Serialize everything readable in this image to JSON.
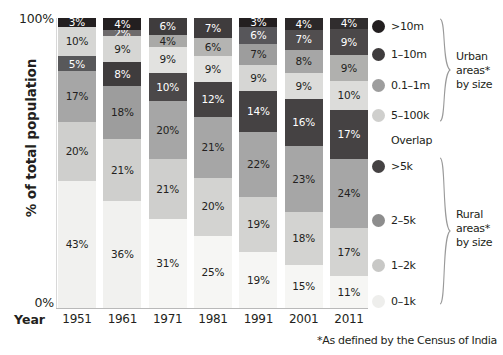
{
  "chart_data": {
    "type": "bar",
    "variant": "stacked-100",
    "title": "",
    "xlabel": "Year",
    "ylabel": "% of total population",
    "ylim": [
      0,
      100
    ],
    "ytick_labels": [
      "100%",
      "0%"
    ],
    "grid": false,
    "legend_position": "right",
    "categories": [
      "1951",
      "1961",
      "1971",
      "1981",
      "1991",
      "2001",
      "2011"
    ],
    "series": [
      {
        "name": ">10m",
        "group": "Urban areas* by size",
        "color": "#231f20",
        "values": [
          3,
          4,
          6,
          7,
          3,
          4,
          4
        ]
      },
      {
        "name": "1–10m",
        "group": "Urban areas* by size",
        "color": "#3f3c3d",
        "values": [
          null,
          2,
          4,
          6,
          6,
          7,
          9
        ]
      },
      {
        "name": "0.1–1m",
        "group": "Urban areas* by size",
        "color": "#9d9d9d",
        "values": [
          10,
          9,
          9,
          9,
          7,
          8,
          9
        ]
      },
      {
        "name": "5–100k",
        "group": "Urban areas* by size",
        "color": "#d6d6d4",
        "values": [
          null,
          null,
          null,
          null,
          9,
          9,
          10
        ]
      },
      {
        "name": ">5k",
        "group": "Overlap / Rural areas* by size",
        "color": "#58585a",
        "values": [
          5,
          8,
          10,
          12,
          14,
          16,
          17
        ]
      },
      {
        "name": "2–5k",
        "group": "Rural areas* by size",
        "color": "#a6a6a6",
        "values": [
          17,
          18,
          20,
          21,
          22,
          23,
          24
        ]
      },
      {
        "name": "1–2k",
        "group": "Rural areas* by size",
        "color": "#cfcfcd",
        "values": [
          20,
          21,
          21,
          20,
          19,
          18,
          17
        ]
      },
      {
        "name": "0–1k",
        "group": "Rural areas* by size",
        "color": "#f1f1ef",
        "values": [
          43,
          36,
          31,
          25,
          19,
          15,
          11
        ]
      }
    ],
    "columns": [
      {
        "year": "1951",
        "segments": [
          {
            "label": "3%",
            "value": 3,
            "color": "#231f20",
            "text": "#ffffff"
          },
          {
            "label": "10%",
            "value": 10,
            "color": "#d6d6d4",
            "text": "#231f20"
          },
          {
            "label": "5%",
            "value": 5,
            "color": "#58585a",
            "text": "#ffffff"
          },
          {
            "label": "17%",
            "value": 17,
            "color": "#a6a6a6",
            "text": "#231f20"
          },
          {
            "label": "20%",
            "value": 20,
            "color": "#cfcfcd",
            "text": "#231f20"
          },
          {
            "label": "43%",
            "value": 43,
            "color": "#f1f1ef",
            "text": "#231f20"
          }
        ]
      },
      {
        "year": "1961",
        "segments": [
          {
            "label": "4%",
            "value": 4,
            "color": "#231f20",
            "text": "#ffffff"
          },
          {
            "label": "2%",
            "value": 2,
            "color": "#6e6b6c",
            "text": "#ffffff"
          },
          {
            "label": "9%",
            "value": 9,
            "color": "#d6d6d4",
            "text": "#231f20"
          },
          {
            "label": "8%",
            "value": 8,
            "color": "#3f3c3d",
            "text": "#ffffff"
          },
          {
            "label": "18%",
            "value": 18,
            "color": "#9d9d9d",
            "text": "#231f20"
          },
          {
            "label": "21%",
            "value": 21,
            "color": "#cfcfcd",
            "text": "#231f20"
          },
          {
            "label": "36%",
            "value": 36,
            "color": "#f1f1ef",
            "text": "#231f20"
          }
        ]
      },
      {
        "year": "1971",
        "segments": [
          {
            "label": "6%",
            "value": 6,
            "color": "#3f3c3d",
            "text": "#ffffff"
          },
          {
            "label": "4%",
            "value": 4,
            "color": "#a9a9a7",
            "text": "#231f20"
          },
          {
            "label": "9%",
            "value": 9,
            "color": "#e2e2e0",
            "text": "#231f20"
          },
          {
            "label": "10%",
            "value": 10,
            "color": "#4b4849",
            "text": "#ffffff"
          },
          {
            "label": "20%",
            "value": 20,
            "color": "#a6a6a6",
            "text": "#231f20"
          },
          {
            "label": "21%",
            "value": 21,
            "color": "#cfcfcd",
            "text": "#231f20"
          },
          {
            "label": "31%",
            "value": 31,
            "color": "#f6f6f4",
            "text": "#231f20"
          }
        ]
      },
      {
        "year": "1981",
        "segments": [
          {
            "label": "7%",
            "value": 7,
            "color": "#3f3c3d",
            "text": "#ffffff"
          },
          {
            "label": "6%",
            "value": 6,
            "color": "#b4b4b2",
            "text": "#231f20"
          },
          {
            "label": "9%",
            "value": 9,
            "color": "#e2e2e0",
            "text": "#231f20"
          },
          {
            "label": "12%",
            "value": 12,
            "color": "#454243",
            "text": "#ffffff"
          },
          {
            "label": "21%",
            "value": 21,
            "color": "#a6a6a6",
            "text": "#231f20"
          },
          {
            "label": "20%",
            "value": 20,
            "color": "#d3d3d1",
            "text": "#231f20"
          },
          {
            "label": "25%",
            "value": 25,
            "color": "#f6f6f4",
            "text": "#231f20"
          }
        ]
      },
      {
        "year": "1991",
        "segments": [
          {
            "label": "3%",
            "value": 3,
            "color": "#231f20",
            "text": "#ffffff"
          },
          {
            "label": "6%",
            "value": 6,
            "color": "#57565a",
            "text": "#ffffff"
          },
          {
            "label": "7%",
            "value": 7,
            "color": "#9d9d9d",
            "text": "#231f20"
          },
          {
            "label": "9%",
            "value": 9,
            "color": "#d6d6d4",
            "text": "#231f20"
          },
          {
            "label": "14%",
            "value": 14,
            "color": "#454243",
            "text": "#ffffff"
          },
          {
            "label": "22%",
            "value": 22,
            "color": "#a6a6a6",
            "text": "#231f20"
          },
          {
            "label": "19%",
            "value": 19,
            "color": "#d3d3d1",
            "text": "#231f20"
          },
          {
            "label": "19%",
            "value": 19,
            "color": "#f6f6f4",
            "text": "#231f20"
          }
        ]
      },
      {
        "year": "2001",
        "segments": [
          {
            "label": "4%",
            "value": 4,
            "color": "#2b2829",
            "text": "#ffffff"
          },
          {
            "label": "7%",
            "value": 7,
            "color": "#514e4f",
            "text": "#ffffff"
          },
          {
            "label": "8%",
            "value": 8,
            "color": "#a6a6a6",
            "text": "#231f20"
          },
          {
            "label": "9%",
            "value": 9,
            "color": "#dcdcda",
            "text": "#231f20"
          },
          {
            "label": "16%",
            "value": 16,
            "color": "#454243",
            "text": "#ffffff"
          },
          {
            "label": "23%",
            "value": 23,
            "color": "#a6a6a6",
            "text": "#231f20"
          },
          {
            "label": "18%",
            "value": 18,
            "color": "#d3d3d1",
            "text": "#231f20"
          },
          {
            "label": "15%",
            "value": 15,
            "color": "#f6f6f4",
            "text": "#231f20"
          }
        ]
      },
      {
        "year": "2011",
        "segments": [
          {
            "label": "4%",
            "value": 4,
            "color": "#302d2e",
            "text": "#ffffff"
          },
          {
            "label": "9%",
            "value": 9,
            "color": "#4b4849",
            "text": "#ffffff"
          },
          {
            "label": "9%",
            "value": 9,
            "color": "#b0b0ae",
            "text": "#231f20"
          },
          {
            "label": "10%",
            "value": 10,
            "color": "#dcdcda",
            "text": "#231f20"
          },
          {
            "label": "17%",
            "value": 17,
            "color": "#454243",
            "text": "#ffffff"
          },
          {
            "label": "24%",
            "value": 24,
            "color": "#a6a6a6",
            "text": "#231f20"
          },
          {
            "label": "17%",
            "value": 17,
            "color": "#d3d3d1",
            "text": "#231f20"
          },
          {
            "label": "11%",
            "value": 11,
            "color": "#f6f6f4",
            "text": "#231f20"
          }
        ]
      }
    ]
  },
  "axis": {
    "y_title": "% of total population",
    "y_top_label": "100%",
    "y_bottom_label": "0%",
    "x_title": "Year"
  },
  "legend": {
    "entries": [
      {
        "label": ">10m",
        "color": "#231f20"
      },
      {
        "label": "1–10m",
        "color": "#3f3c3d"
      },
      {
        "label": "0.1–1m",
        "color": "#9d9d9d"
      },
      {
        "label": "5–100k",
        "color": "#cfcfcd"
      },
      {
        "label": ">5k",
        "color": "#454243"
      },
      {
        "label": "2–5k",
        "color": "#8d8d8d"
      },
      {
        "label": "1–2k",
        "color": "#c8c8c6"
      },
      {
        "label": "0–1k",
        "color": "#eeeeec"
      }
    ],
    "overlap_label": "Overlap",
    "group_urban": "Urban\nareas*\nby size",
    "group_urban_line1": "Urban",
    "group_urban_line2": "areas*",
    "group_urban_line3": "by size",
    "group_rural_line1": "Rural",
    "group_rural_line2": "areas*",
    "group_rural_line3": "by size"
  },
  "footnote": "*As defined by the Census of India"
}
